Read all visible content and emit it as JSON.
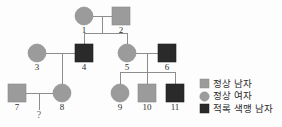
{
  "diagram": {
    "type": "pedigree-chart",
    "title": "",
    "colors": {
      "normal_fill": "#9b9b9b",
      "affected_fill": "#2a2a2a",
      "line": "#8d8d8d",
      "label": "#2e2e2e",
      "background": "#fdfdfd"
    },
    "individuals": [
      {
        "id": "1",
        "label": "1",
        "sex": "female",
        "shape": "circle",
        "status": "normal",
        "fill": "#9b9b9b",
        "generation": 1,
        "x": 84,
        "y": 16
      },
      {
        "id": "2",
        "label": "2",
        "sex": "male",
        "shape": "square",
        "status": "normal",
        "fill": "#9b9b9b",
        "generation": 1,
        "x": 121,
        "y": 16
      },
      {
        "id": "3",
        "label": "3",
        "sex": "female",
        "shape": "circle",
        "status": "normal",
        "fill": "#9b9b9b",
        "generation": 2,
        "x": 37,
        "y": 53
      },
      {
        "id": "4",
        "label": "4",
        "sex": "male",
        "shape": "square",
        "status": "affected",
        "fill": "#2a2a2a",
        "generation": 2,
        "x": 84,
        "y": 53
      },
      {
        "id": "5",
        "label": "5",
        "sex": "female",
        "shape": "circle",
        "status": "normal",
        "fill": "#9b9b9b",
        "generation": 2,
        "x": 127,
        "y": 53
      },
      {
        "id": "6",
        "label": "6",
        "sex": "male",
        "shape": "square",
        "status": "affected",
        "fill": "#2a2a2a",
        "generation": 2,
        "x": 167,
        "y": 53
      },
      {
        "id": "7",
        "label": "7",
        "sex": "male",
        "shape": "square",
        "status": "normal",
        "fill": "#9b9b9b",
        "generation": 3,
        "x": 17,
        "y": 93
      },
      {
        "id": "8",
        "label": "8",
        "sex": "female",
        "shape": "circle",
        "status": "normal",
        "fill": "#9b9b9b",
        "generation": 3,
        "x": 62,
        "y": 93
      },
      {
        "id": "9",
        "label": "9",
        "sex": "female",
        "shape": "circle",
        "status": "normal",
        "fill": "#9b9b9b",
        "generation": 3,
        "x": 120,
        "y": 93
      },
      {
        "id": "10",
        "label": "10",
        "sex": "male",
        "shape": "square",
        "status": "normal",
        "fill": "#9b9b9b",
        "generation": 3,
        "x": 147,
        "y": 93
      },
      {
        "id": "11",
        "label": "11",
        "sex": "male",
        "shape": "square",
        "status": "affected",
        "fill": "#2a2a2a",
        "generation": 3,
        "x": 175,
        "y": 93
      }
    ],
    "unknown_offspring": {
      "label": "?",
      "parents": [
        "7",
        "8"
      ],
      "x": 39,
      "y": 116
    },
    "matings": [
      {
        "partners": [
          "1",
          "2"
        ],
        "children": [
          "4",
          "5"
        ]
      },
      {
        "partners": [
          "3",
          "4"
        ],
        "children": [
          "8"
        ]
      },
      {
        "partners": [
          "5",
          "6"
        ],
        "children": [
          "9",
          "10",
          "11"
        ]
      },
      {
        "partners": [
          "7",
          "8"
        ],
        "children": [
          "?"
        ]
      }
    ]
  },
  "legend": {
    "items": [
      {
        "key": "normal-male",
        "marker": "square",
        "fill": "#9b9b9b",
        "label": "정상 남자"
      },
      {
        "key": "normal-female",
        "marker": "circle",
        "fill": "#9b9b9b",
        "label": "정상 여자"
      },
      {
        "key": "colorblind-male",
        "marker": "square",
        "fill": "#2a2a2a",
        "label": "적록 색맹 남자"
      }
    ]
  }
}
